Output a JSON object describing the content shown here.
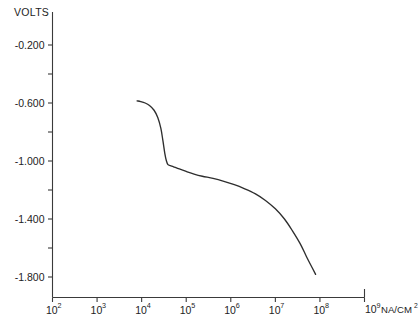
{
  "chart_data": {
    "type": "line",
    "title": "",
    "ylabel": "VOLTS",
    "xlabel": "NA/CM2",
    "xlabel_base": "10",
    "xlabel_exp": "9",
    "xlabel_unit": "NA/CM",
    "xlabel_unit_exp": "2",
    "xscale": "log",
    "xlim": [
      100,
      1000000000
    ],
    "ylim": [
      -2.0,
      -0.02
    ],
    "grid": false,
    "legend": null,
    "x_tick_labels": [
      {
        "base": "10",
        "exp": "2",
        "value": 100
      },
      {
        "base": "10",
        "exp": "3",
        "value": 1000
      },
      {
        "base": "10",
        "exp": "4",
        "value": 10000
      },
      {
        "base": "10",
        "exp": "5",
        "value": 100000
      },
      {
        "base": "10",
        "exp": "6",
        "value": 1000000
      },
      {
        "base": "10",
        "exp": "7",
        "value": 10000000
      },
      {
        "base": "10",
        "exp": "8",
        "value": 100000000
      },
      {
        "base": "10",
        "exp": "9",
        "value": 1000000000
      }
    ],
    "y_tick_labels_major": [
      "-0.200",
      "-0.600",
      "-1.000",
      "-1.400",
      "-1.800"
    ],
    "y_ticks_major": [
      -0.2,
      -0.6,
      -1.0,
      -1.4,
      -1.8
    ],
    "y_ticks_minor": [
      -0.4,
      -0.8,
      -1.2,
      -1.6
    ],
    "series": [
      {
        "name": "polarization curve",
        "points": [
          [
            7900,
            -0.585
          ],
          [
            9500,
            -0.59
          ],
          [
            12000,
            -0.6
          ],
          [
            15000,
            -0.617
          ],
          [
            19000,
            -0.65
          ],
          [
            23000,
            -0.7
          ],
          [
            27000,
            -0.775
          ],
          [
            30000,
            -0.86
          ],
          [
            33000,
            -0.945
          ],
          [
            36000,
            -1.0
          ],
          [
            39000,
            -1.025
          ],
          [
            44000,
            -1.032
          ],
          [
            52000,
            -1.04
          ],
          [
            70000,
            -1.055
          ],
          [
            100000,
            -1.072
          ],
          [
            150000,
            -1.09
          ],
          [
            230000,
            -1.105
          ],
          [
            400000,
            -1.12
          ],
          [
            700000,
            -1.14
          ],
          [
            1200000,
            -1.163
          ],
          [
            2000000,
            -1.19
          ],
          [
            3500000,
            -1.225
          ],
          [
            6000000,
            -1.272
          ],
          [
            10000000,
            -1.33
          ],
          [
            16000000,
            -1.4
          ],
          [
            24000000,
            -1.48
          ],
          [
            36000000,
            -1.57
          ],
          [
            50000000,
            -1.66
          ],
          [
            68000000,
            -1.74
          ],
          [
            80000000,
            -1.782
          ]
        ]
      }
    ]
  }
}
